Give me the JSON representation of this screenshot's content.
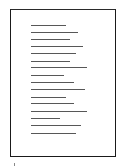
{
  "document": {
    "type": "page-thumbnail",
    "border_color": "#1a1a1a",
    "line_color": "#3a3a3a",
    "text_lines": [
      {
        "y": 25,
        "x": 31,
        "end": 66
      },
      {
        "y": 32,
        "x": 31,
        "end": 78
      },
      {
        "y": 39,
        "x": 31,
        "end": 70
      },
      {
        "y": 46,
        "x": 31,
        "end": 83
      },
      {
        "y": 53,
        "x": 31,
        "end": 76
      },
      {
        "y": 61,
        "x": 31,
        "end": 70
      },
      {
        "y": 67,
        "x": 31,
        "end": 87
      },
      {
        "y": 75,
        "x": 31,
        "end": 64
      },
      {
        "y": 82,
        "x": 31,
        "end": 74
      },
      {
        "y": 89,
        "x": 31,
        "end": 85
      },
      {
        "y": 97,
        "x": 31,
        "end": 66
      },
      {
        "y": 103,
        "x": 31,
        "end": 74
      },
      {
        "y": 111,
        "x": 31,
        "end": 87
      },
      {
        "y": 118,
        "x": 31,
        "end": 60
      },
      {
        "y": 125,
        "x": 31,
        "end": 81
      },
      {
        "y": 133,
        "x": 31,
        "end": 76
      }
    ]
  }
}
